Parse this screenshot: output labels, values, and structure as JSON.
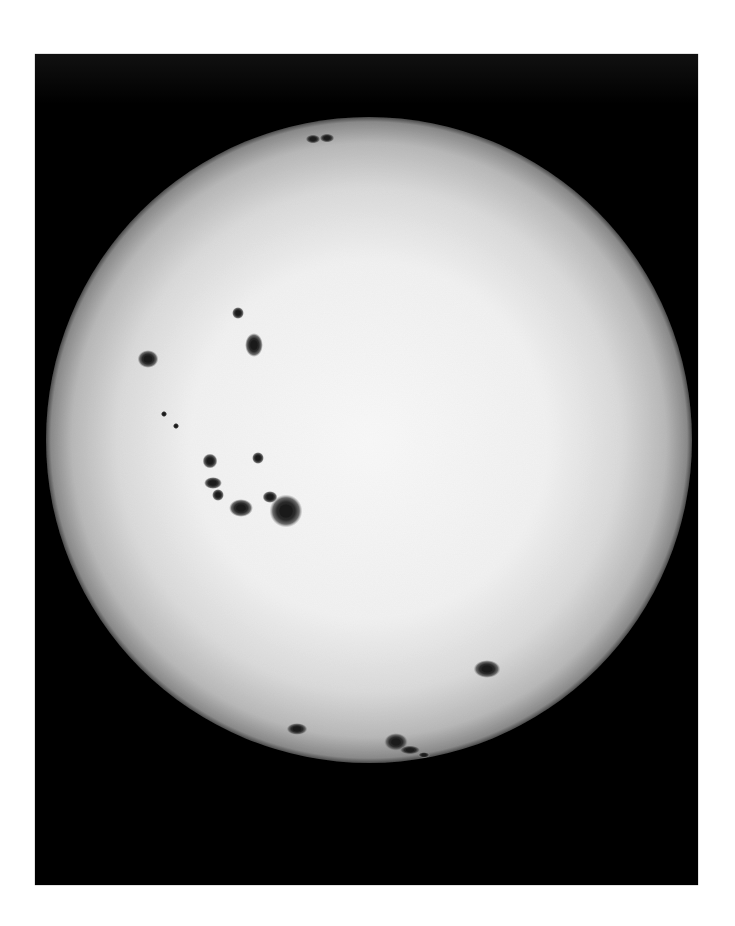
{
  "image": {
    "subject": "Sun in white light with sunspot groups",
    "alt_text": "Full-disk photograph of the Sun showing several sunspot groups"
  },
  "colors": {
    "page_background": "#ffffff",
    "frame_background": "#000000",
    "disk_center": "#f8f8f8",
    "disk_mid": "#e6e6e6",
    "disk_limb": "#8a8a8a",
    "sunspot_umbra": "#1a1a1a",
    "sunspot_penumbra": "#6a6a6a"
  },
  "disk": {
    "cx": 369,
    "cy": 440,
    "r": 323
  },
  "sunspots": [
    {
      "x": 313,
      "y": 139,
      "rx": 5,
      "ry": 3
    },
    {
      "x": 327,
      "y": 138,
      "rx": 5,
      "ry": 3
    },
    {
      "x": 238,
      "y": 313,
      "rx": 4,
      "ry": 4
    },
    {
      "x": 254,
      "y": 345,
      "rx": 6,
      "ry": 8
    },
    {
      "x": 148,
      "y": 359,
      "rx": 7,
      "ry": 6
    },
    {
      "x": 164,
      "y": 414,
      "rx": 2,
      "ry": 2
    },
    {
      "x": 176,
      "y": 426,
      "rx": 2,
      "ry": 2
    },
    {
      "x": 210,
      "y": 461,
      "rx": 5,
      "ry": 5
    },
    {
      "x": 258,
      "y": 458,
      "rx": 4,
      "ry": 4
    },
    {
      "x": 213,
      "y": 483,
      "rx": 6,
      "ry": 4
    },
    {
      "x": 218,
      "y": 495,
      "rx": 4,
      "ry": 4
    },
    {
      "x": 270,
      "y": 497,
      "rx": 5,
      "ry": 4
    },
    {
      "x": 241,
      "y": 508,
      "rx": 8,
      "ry": 6
    },
    {
      "x": 286,
      "y": 511,
      "rx": 11,
      "ry": 11
    },
    {
      "x": 487,
      "y": 669,
      "rx": 9,
      "ry": 6
    },
    {
      "x": 297,
      "y": 729,
      "rx": 7,
      "ry": 4
    },
    {
      "x": 396,
      "y": 742,
      "rx": 8,
      "ry": 6
    },
    {
      "x": 410,
      "y": 750,
      "rx": 7,
      "ry": 3
    },
    {
      "x": 424,
      "y": 755,
      "rx": 4,
      "ry": 2
    }
  ]
}
